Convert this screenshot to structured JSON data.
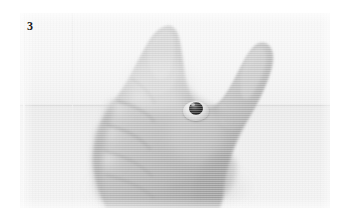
{
  "figure": {
    "number_label": "3",
    "caption": "",
    "alt_description": "Black-and-white photograph of a closed right hand, fist held sideways with the thumb extended upward, a small dark round stud ornament resting in the web of skin between the thumb and index finger",
    "plate": {
      "background_upper_color": "#f4f4f4",
      "background_lower_color": "#ececec",
      "horizon_color": "#dedede",
      "page_color": "#ffffff"
    },
    "subject": {
      "name": "hand",
      "pose": "fist with raised thumb",
      "skin_midtone_color": "#b9b9b9",
      "skin_highlight_color": "#dcdcdc",
      "skin_shadow_color": "#8f8f8f"
    },
    "ornament": {
      "name": "stud",
      "stone_color": "#1d1d1d",
      "setting_color": "#d8d8d8"
    }
  }
}
